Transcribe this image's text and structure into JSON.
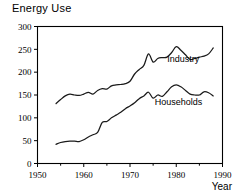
{
  "chart_data": {
    "type": "line",
    "title": "Energy Use",
    "xlabel": "Year",
    "ylabel": "",
    "xlim": [
      1950,
      1990
    ],
    "ylim": [
      0,
      300
    ],
    "xticks": [
      1950,
      1960,
      1970,
      1980,
      1990
    ],
    "xtick_labels": [
      "1950",
      "1960",
      "1970",
      "1980",
      "1990"
    ],
    "xminor_ticks": [
      1955,
      1965,
      1975,
      1985
    ],
    "yticks": [
      0,
      50,
      100,
      150,
      200,
      250,
      300
    ],
    "ytick_labels": [
      "0",
      "50",
      "100",
      "150",
      "200",
      "250",
      "300"
    ],
    "grid": false,
    "legend_position": "inline-right-of-series",
    "x": [
      1954,
      1955,
      1956,
      1957,
      1958,
      1959,
      1960,
      1961,
      1962,
      1963,
      1964,
      1965,
      1966,
      1967,
      1968,
      1969,
      1970,
      1971,
      1972,
      1973,
      1974,
      1975,
      1976,
      1977,
      1978,
      1979,
      1980,
      1981,
      1982,
      1983,
      1984,
      1985,
      1986,
      1987,
      1988
    ],
    "series": [
      {
        "name": "Industry",
        "label": "Industry",
        "color": "#1a1a1a",
        "values": [
          131,
          140,
          148,
          152,
          150,
          149,
          152,
          156,
          152,
          160,
          164,
          163,
          170,
          172,
          173,
          175,
          180,
          196,
          206,
          215,
          240,
          222,
          230,
          232,
          233,
          243,
          256,
          248,
          238,
          228,
          230,
          233,
          235,
          240,
          253
        ]
      },
      {
        "name": "Households",
        "label": "Households",
        "color": "#1a1a1a",
        "values": [
          42,
          46,
          48,
          49,
          49,
          48,
          52,
          58,
          63,
          68,
          90,
          92,
          100,
          106,
          112,
          120,
          126,
          133,
          142,
          148,
          156,
          143,
          150,
          147,
          157,
          168,
          172,
          168,
          160,
          152,
          150,
          150,
          157,
          155,
          148
        ]
      }
    ],
    "annotations": [
      {
        "text": "Industry",
        "x": 1981.5,
        "y": 222
      },
      {
        "text": "Households",
        "x": 1980.5,
        "y": 128
      }
    ]
  }
}
